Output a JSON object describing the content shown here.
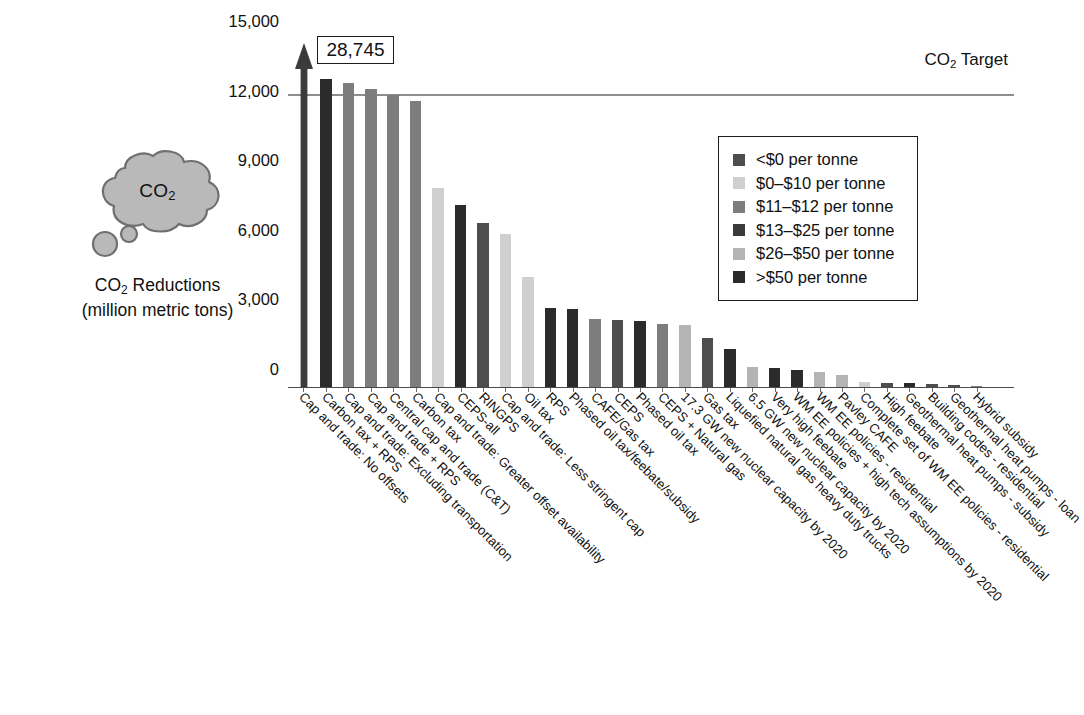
{
  "annotation": {
    "cloud_text": "CO2",
    "caption_line1": "CO2 Reductions",
    "caption_line2": "(million metric tons)",
    "caption_line1_pre": "CO",
    "caption_line1_sub": "2",
    "caption_line1_post": " Reductions"
  },
  "callout": {
    "value_label": "28,745",
    "icon": "up-arrow-icon"
  },
  "target": {
    "label_pre": "CO",
    "label_sub": "2",
    "label_post": " Target",
    "label": "CO2 Target",
    "value": 12600
  },
  "legend": {
    "position": "top-right",
    "items": [
      {
        "label": "<$0 per tonne",
        "color": "#4e4e4e"
      },
      {
        "label": "$0–$10 per tonne",
        "color": "#cfcfcf"
      },
      {
        "label": "$11–$12 per tonne",
        "color": "#7d7d7d"
      },
      {
        "label": "$13–$25 per tonne",
        "color": "#3b3b3b"
      },
      {
        "label": "$26–$50 per tonne",
        "color": "#b4b4b4"
      },
      {
        "label": ">$50 per tonne",
        "color": "#2b2b2b"
      }
    ]
  },
  "chart_data": {
    "type": "bar",
    "title": "",
    "xlabel": "",
    "ylabel": "CO2 Reductions (million metric tons)",
    "ylim": [
      0,
      15000
    ],
    "yticks": [
      "0",
      "3,000",
      "6,000",
      "9,000",
      "12,000",
      "15,000"
    ],
    "ytick_values": [
      0,
      3000,
      6000,
      9000,
      12000,
      15000
    ],
    "grid": false,
    "target_line": 12600,
    "target_line_label": "CO2 Target",
    "categories": [
      "Cap and trade: No offsets",
      "Carbon tax + RPS",
      "Cap and trade: Excluding transportation",
      "Cap and trade + RPS",
      "Central cap and trade (C&T)",
      "Carbon tax",
      "Cap and trade: Greater offset availability",
      "CEPS-all",
      "RINGPS",
      "Cap and trade: Less stringent cap",
      "Oil tax",
      "RPS",
      "Phased oil tax/feebate/subsidy",
      "CAFE/Gas tax",
      "CEPS",
      "Phased oil tax",
      "CEPS + Natural gas",
      "17.3 GW new nuclear capacity by 2020",
      "Gas tax",
      "Liquefied natural gas heavy duty trucks",
      "6.5 GW new nuclear capacity by 2020",
      "Very high feebate",
      "WM EE policies + high tech assumptions by 2020",
      "WM EE policies - residential",
      "Pavley CAFE",
      "Complete set of WM EE policies - residential",
      "High feebate",
      "Geothermal heat pumps - subsidy",
      "Building codes - residential",
      "Geothermal heat pumps - loan",
      "Hybrid subsidy"
    ],
    "values": [
      28745,
      13300,
      13150,
      12900,
      12650,
      12350,
      8600,
      7900,
      7100,
      6650,
      4800,
      3450,
      3400,
      2980,
      2950,
      2900,
      2750,
      2700,
      2150,
      1700,
      900,
      850,
      780,
      700,
      580,
      260,
      230,
      200,
      180,
      120,
      60
    ],
    "value_colors": [
      "#3b3b3b",
      "#2b2b2b",
      "#7d7d7d",
      "#7d7d7d",
      "#7d7d7d",
      "#7d7d7d",
      "#cfcfcf",
      "#2b2b2b",
      "#4e4e4e",
      "#cfcfcf",
      "#cfcfcf",
      "#2b2b2b",
      "#2b2b2b",
      "#7d7d7d",
      "#4e4e4e",
      "#2b2b2b",
      "#7d7d7d",
      "#b4b4b4",
      "#4e4e4e",
      "#2b2b2b",
      "#b4b4b4",
      "#2b2b2b",
      "#2b2b2b",
      "#b4b4b4",
      "#b4b4b4",
      "#cfcfcf",
      "#4e4e4e",
      "#2b2b2b",
      "#4e4e4e",
      "#4e4e4e",
      "#7d7d7d"
    ],
    "first_bar_is_broken_axis": true,
    "first_bar_display": "28,745"
  }
}
